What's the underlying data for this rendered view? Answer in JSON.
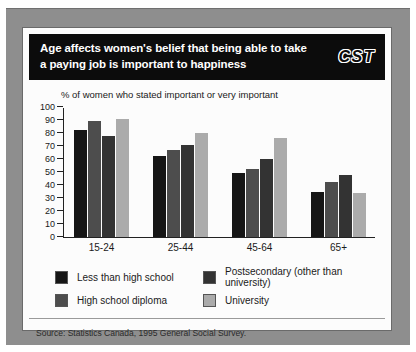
{
  "window": {
    "frame_color": "#8e8e8e",
    "card_bg": "#fcfcfc"
  },
  "header": {
    "title_line1": "Age affects women's belief that being able to take",
    "title_line2": "a paying job is important to happiness",
    "logo": "CST"
  },
  "chart_data": {
    "type": "bar",
    "title": "Age affects women's belief that being able to take a paying job is important to happiness",
    "subtitle": "% of women who stated important or very important",
    "categories": [
      "15-24",
      "25-44",
      "45-64",
      "65+"
    ],
    "series": [
      {
        "name": "Less than high school",
        "color": "#161616",
        "values": [
          82,
          62,
          49,
          35
        ]
      },
      {
        "name": "High school diploma",
        "color": "#4d4d4d",
        "values": [
          89,
          67,
          52,
          42
        ]
      },
      {
        "name": "Postsecondary (other than university)",
        "color": "#333333",
        "values": [
          78,
          71,
          60,
          48
        ]
      },
      {
        "name": "University",
        "color": "#ababab",
        "values": [
          91,
          80,
          76,
          34
        ]
      }
    ],
    "ylim": [
      0,
      100
    ],
    "ytick_step": 10,
    "grid": false,
    "legend_position": "bottom"
  },
  "footer": {
    "source": "Source: Statistics Canada, 1995 General Social Survey."
  }
}
